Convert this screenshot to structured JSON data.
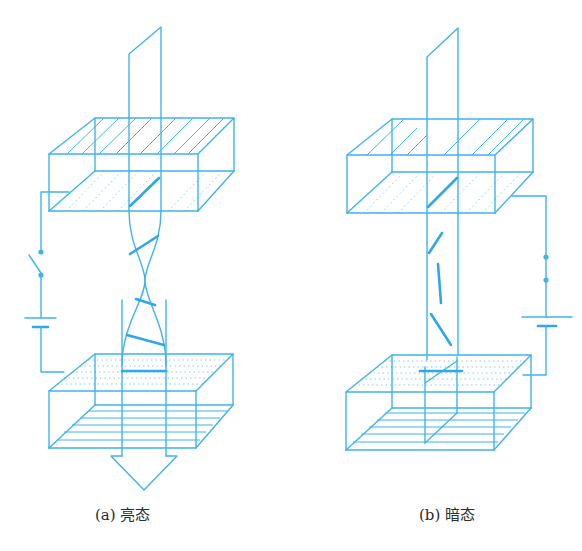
{
  "figure": {
    "type": "liquid-crystal-cell-schematic",
    "line_color": "#3fb4ea",
    "panels": [
      {
        "id": "a",
        "caption": "(a) 亮态",
        "label": "(a)",
        "state": "亮态",
        "circuit": "switch-open",
        "liquid_crystal": "twisted",
        "light_output": "arrow-down"
      },
      {
        "id": "b",
        "caption": "(b) 暗态",
        "label": "(b)",
        "state": "暗态",
        "circuit": "switch-closed",
        "liquid_crystal": "aligned-with-field",
        "light_output": "blocked"
      }
    ]
  }
}
